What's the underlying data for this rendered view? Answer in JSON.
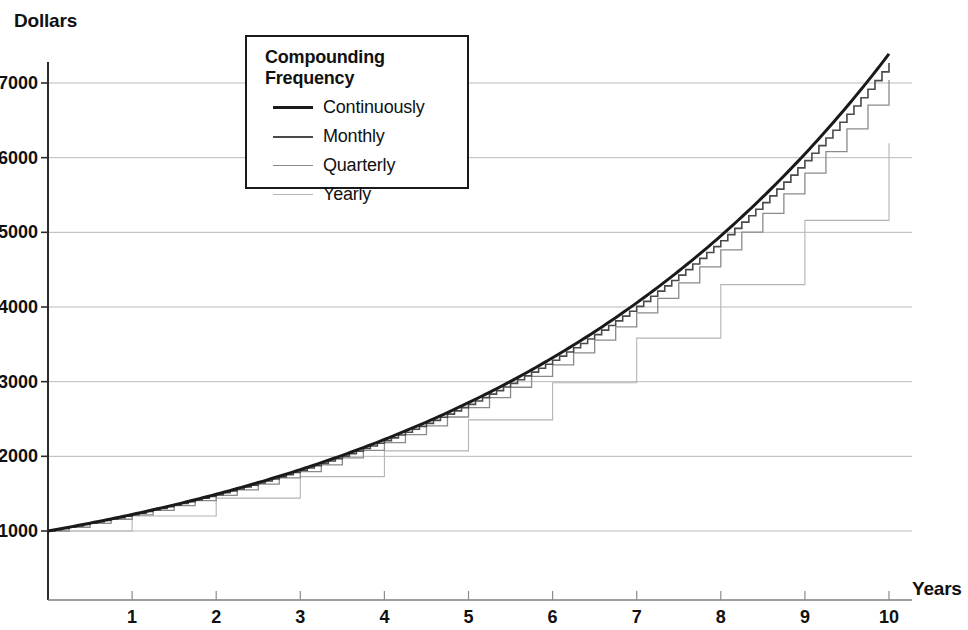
{
  "chart_data": {
    "type": "line",
    "title": "",
    "xlabel": "Years",
    "ylabel": "Dollars",
    "xlim": [
      0,
      10.3
    ],
    "ylim": [
      0,
      7800
    ],
    "grid": true,
    "x_ticks": [
      "1",
      "2",
      "3",
      "4",
      "5",
      "6",
      "7",
      "8",
      "9",
      "10"
    ],
    "x_tick_values": [
      1,
      2,
      3,
      4,
      5,
      6,
      7,
      8,
      9,
      10
    ],
    "y_ticks": [
      "1000",
      "2000",
      "3000",
      "4000",
      "5000",
      "6000",
      "7000"
    ],
    "y_tick_values": [
      1000,
      2000,
      3000,
      4000,
      5000,
      6000,
      7000
    ],
    "legend": {
      "title": "Compounding Frequency",
      "position": "upper-left-inset",
      "entries": [
        {
          "label": "Continuously",
          "color": "#1a1a1a",
          "width": 3.0
        },
        {
          "label": "Monthly",
          "color": "#4a4a4a",
          "width": 1.6
        },
        {
          "label": "Quarterly",
          "color": "#8a8a8a",
          "width": 1.3
        },
        {
          "label": "Yearly",
          "color": "#b4b4b4",
          "width": 1.1
        }
      ]
    },
    "principal": 1000,
    "annual_rate": 0.2,
    "series": [
      {
        "name": "Continuously",
        "style": "smooth",
        "x": [
          0,
          0.5,
          1,
          1.5,
          2,
          2.5,
          3,
          3.5,
          4,
          4.5,
          5,
          5.5,
          6,
          6.5,
          7,
          7.5,
          8,
          8.5,
          9,
          9.5,
          10
        ],
        "values": [
          1000,
          1105,
          1221,
          1350,
          1492,
          1649,
          1822,
          2014,
          2226,
          2460,
          2718,
          3004,
          3320,
          3669,
          4055,
          4482,
          4953,
          5474,
          6050,
          6686,
          7389
        ]
      },
      {
        "name": "Monthly",
        "style": "step-monthly",
        "x": [
          0,
          1,
          2,
          3,
          4,
          5,
          6,
          7,
          8,
          9,
          10
        ],
        "values": [
          1000,
          1219,
          1486,
          1811,
          2208,
          2691,
          3281,
          3999,
          4875,
          5943,
          7244
        ]
      },
      {
        "name": "Quarterly",
        "style": "step-quarterly",
        "x": [
          0,
          1,
          2,
          3,
          4,
          5,
          6,
          7,
          8,
          9,
          10
        ],
        "values": [
          1000,
          1216,
          1477,
          1796,
          2183,
          2653,
          3225,
          3920,
          4765,
          5792,
          7040
        ]
      },
      {
        "name": "Yearly",
        "style": "step-yearly",
        "x": [
          0,
          1,
          2,
          3,
          4,
          5,
          6,
          7,
          8,
          9,
          10
        ],
        "values": [
          1000,
          1200,
          1440,
          1728,
          2074,
          2488,
          2986,
          3583,
          4300,
          5160,
          6192
        ]
      }
    ]
  }
}
